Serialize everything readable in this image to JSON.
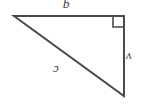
{
  "figure": {
    "type": "right-triangle",
    "background_color": "#ffffff",
    "stroke_color": "#4a4a4a",
    "label_color": "#3f3f3f",
    "width": 145,
    "height": 106,
    "vertices": {
      "top_left": {
        "x": 14,
        "y": 16
      },
      "top_right": {
        "x": 124,
        "y": 16
      },
      "bottom_right": {
        "x": 124,
        "y": 96
      }
    },
    "right_angle": {
      "at_vertex": "top_right",
      "marker_size": 11,
      "marker_shape": "square"
    },
    "labels": {
      "top_side": "q",
      "right_side": "v",
      "hypotenuse": "c"
    },
    "label_rotation_degrees": 180
  }
}
